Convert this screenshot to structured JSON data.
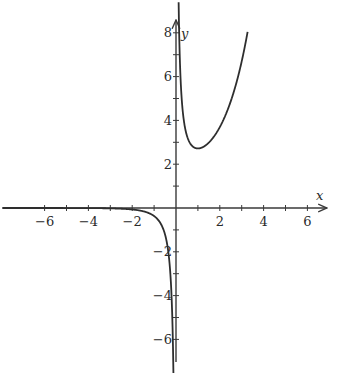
{
  "chart_data": {
    "type": "line",
    "title": "",
    "function": "y = e^x / x",
    "xlabel": "x",
    "ylabel": "y",
    "xlim": [
      -7.2,
      6.8
    ],
    "ylim": [
      -7,
      8.6
    ],
    "grid": false,
    "legend": null,
    "x_ticks": [
      -6,
      -5,
      -4,
      -3,
      -2,
      -1,
      1,
      2,
      3,
      4,
      5,
      6
    ],
    "x_tick_labels": [
      "-6",
      "-4",
      "-2",
      "2",
      "4",
      "6"
    ],
    "x_tick_label_values": [
      -6,
      -4,
      -2,
      2,
      4,
      6
    ],
    "y_ticks": [
      -6,
      -5,
      -4,
      -3,
      -2,
      -1,
      1,
      2,
      3,
      4,
      5,
      6,
      7,
      8
    ],
    "y_tick_labels": [
      "8",
      "6",
      "4",
      "2",
      "-2",
      "-4",
      "-6"
    ],
    "y_tick_label_values": [
      8,
      6,
      4,
      2,
      -2,
      -4,
      -6
    ],
    "series": [
      {
        "name": "right branch (x>0)",
        "x": [
          0.12,
          0.15,
          0.2,
          0.3,
          0.4,
          0.5,
          0.7,
          1.0,
          1.3,
          1.6,
          2.0,
          2.4,
          2.8,
          3.0,
          3.27
        ],
        "y": [
          8.0,
          7.74,
          6.11,
          4.5,
          3.73,
          3.3,
          2.88,
          2.72,
          2.83,
          3.1,
          3.69,
          4.6,
          5.88,
          6.7,
          8.04
        ]
      },
      {
        "name": "left branch (x<0)",
        "x": [
          -7.2,
          -6,
          -5,
          -4,
          -3,
          -2.5,
          -2,
          -1.5,
          -1.2,
          -1,
          -0.8,
          -0.6,
          -0.4,
          -0.3,
          -0.2,
          -0.15,
          -0.12
        ],
        "y": [
          -0.0001,
          -0.0004,
          -0.0013,
          -0.0046,
          -0.0166,
          -0.0328,
          -0.0677,
          -0.149,
          -0.251,
          -0.368,
          -0.562,
          -0.915,
          -1.676,
          -2.469,
          -4.094,
          -5.737,
          -7.4
        ]
      }
    ],
    "annotations": {
      "minimum": {
        "x": 1,
        "y": 2.718
      }
    },
    "colors": {
      "curve": "#2e2e2e",
      "axes": "#3a3a3a"
    }
  }
}
